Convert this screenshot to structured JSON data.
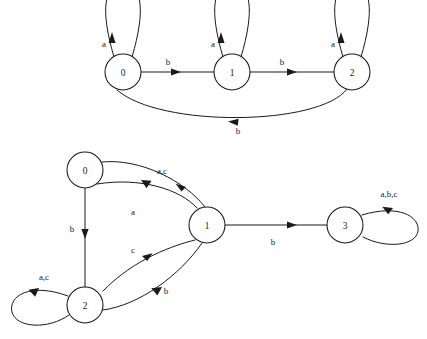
{
  "figure": {
    "background_color": "#ffffff",
    "ink_color": "#1a1a1a",
    "width": 427,
    "height": 339
  },
  "diagrams": [
    {
      "id": "top-automaton",
      "name": "three-state-automaton",
      "alphabet": [
        "a",
        "b"
      ],
      "states": [
        {
          "id": "t0",
          "label": "0",
          "cx": 123,
          "cy": 72,
          "r": 18
        },
        {
          "id": "t1",
          "label": "1",
          "cx": 232,
          "cy": 72,
          "r": 18
        },
        {
          "id": "t2",
          "label": "2",
          "cx": 352,
          "cy": 72,
          "r": 18
        }
      ],
      "transitions": [
        {
          "id": "t0-self",
          "from": "t0",
          "to": "t0",
          "label": "a",
          "label_x": 104,
          "label_y": 44,
          "kind": "self-loop-up"
        },
        {
          "id": "t1-self",
          "from": "t1",
          "to": "t1",
          "label": "a",
          "label_x": 213,
          "label_y": 44,
          "kind": "self-loop-up"
        },
        {
          "id": "t2-self",
          "from": "t2",
          "to": "t2",
          "label": "a",
          "label_x": 333,
          "label_y": 44,
          "kind": "self-loop-up"
        },
        {
          "id": "t0-t1",
          "from": "t0",
          "to": "t1",
          "label": "b",
          "label_x": 168,
          "label_y": 62,
          "kind": "straight"
        },
        {
          "id": "t1-t2",
          "from": "t1",
          "to": "t2",
          "label": "b",
          "label_x": 282,
          "label_y": 62,
          "kind": "straight"
        },
        {
          "id": "t2-t0",
          "from": "t2",
          "to": "t0",
          "label": "b",
          "label_x": 238,
          "label_y": 131,
          "kind": "arc-below"
        }
      ]
    },
    {
      "id": "bottom-automaton",
      "name": "four-state-automaton",
      "alphabet": [
        "a",
        "b",
        "c"
      ],
      "states": [
        {
          "id": "b0",
          "label": "0",
          "cx": 85,
          "cy": 170,
          "r": 18
        },
        {
          "id": "b1",
          "label": "1",
          "cx": 207,
          "cy": 225,
          "r": 18
        },
        {
          "id": "b2",
          "label": "2",
          "cx": 85,
          "cy": 305,
          "r": 18
        },
        {
          "id": "b3",
          "label": "3",
          "cx": 345,
          "cy": 225,
          "r": 18
        }
      ],
      "transitions": [
        {
          "id": "b0-b1",
          "from": "b0",
          "to": "b1",
          "label": "a,c",
          "label_x": 162,
          "label_y": 171,
          "kind": "arc"
        },
        {
          "id": "b1-b0",
          "from": "b1",
          "to": "b0",
          "label": "a",
          "label_x": 133,
          "label_y": 212,
          "kind": "arc"
        },
        {
          "id": "b0-b2",
          "from": "b0",
          "to": "b2",
          "label": "b",
          "label_x": 72,
          "label_y": 229,
          "kind": "straight"
        },
        {
          "id": "b1-b2",
          "from": "b1",
          "to": "b2",
          "label": "c",
          "label_x": 133,
          "label_y": 250,
          "kind": "arc"
        },
        {
          "id": "b2-b1",
          "from": "b2",
          "to": "b1",
          "label": "b",
          "label_x": 166,
          "label_y": 291,
          "kind": "arc"
        },
        {
          "id": "b2-self",
          "from": "b2",
          "to": "b2",
          "label": "a,c",
          "label_x": 44,
          "label_y": 277,
          "kind": "self-loop-left"
        },
        {
          "id": "b1-b3",
          "from": "b1",
          "to": "b3",
          "label": "b",
          "label_x": 273,
          "label_y": 242,
          "kind": "straight"
        },
        {
          "id": "b3-self",
          "from": "b3",
          "to": "b3",
          "label": "a,b,c",
          "label_x": 389,
          "label_y": 194,
          "kind": "self-loop-right"
        }
      ]
    }
  ]
}
